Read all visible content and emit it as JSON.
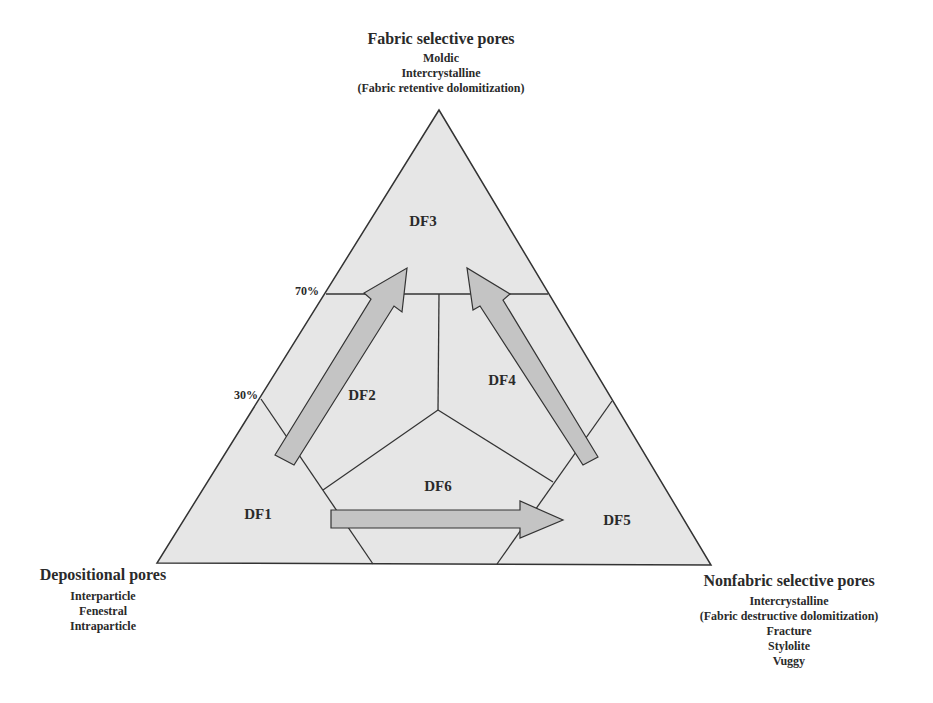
{
  "vertices": {
    "top": {
      "title": "Fabric selective pores",
      "items": [
        "Moldic",
        "Intercrystalline",
        "(Fabric retentive dolomitization)"
      ]
    },
    "bottom_left": {
      "title": "Depositional pores",
      "items": [
        "Interparticle",
        "Fenestral",
        "Intraparticle"
      ]
    },
    "bottom_right": {
      "title": "Nonfabric selective pores",
      "items": [
        "Intercrystalline",
        "(Fabric destructive dolomitization)",
        "Fracture",
        "Stylolite",
        "Vuggy"
      ]
    }
  },
  "regions": {
    "df1": "DF1",
    "df2": "DF2",
    "df3": "DF3",
    "df4": "DF4",
    "df5": "DF5",
    "df6": "DF6"
  },
  "thresholds": {
    "upper": "70%",
    "lower": "30%"
  },
  "arrows": [
    {
      "from": "DF1",
      "to": "DF3"
    },
    {
      "from": "DF5",
      "to": "DF3"
    },
    {
      "from": "DF1",
      "to": "DF5"
    }
  ],
  "colors": {
    "triangle_fill": "#e6e6e6",
    "arrow_fill": "#c4c4c4",
    "line": "#333333",
    "text": "#2a2a2a"
  }
}
